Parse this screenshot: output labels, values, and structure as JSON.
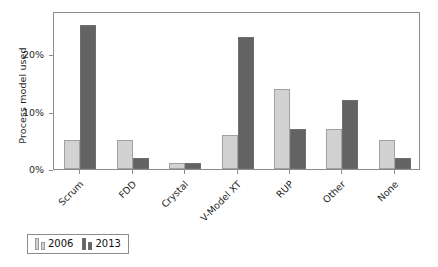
{
  "chart_data": {
    "type": "bar",
    "title": "",
    "subtitle": "",
    "xlabel": "",
    "ylabel": "Process model used",
    "categories": [
      "Scrum",
      "FDD",
      "Crystal",
      "V-Model XT",
      "RUP",
      "Other",
      "None"
    ],
    "series": [
      {
        "name": "2006",
        "color": "#d2d2d2",
        "values": [
          5,
          5,
          1,
          6,
          14,
          7,
          5
        ]
      },
      {
        "name": "2013",
        "color": "#636363",
        "values": [
          25,
          2,
          1,
          23,
          7,
          12,
          2
        ]
      }
    ],
    "ylim": [
      0,
      27.5
    ],
    "yticks": [
      0,
      10,
      20
    ],
    "ytick_labels": [
      "0%",
      "10%",
      "20%"
    ],
    "grid": false,
    "legend_position": "below-left",
    "value_unit": "%"
  },
  "legend": {
    "entries": [
      {
        "label": "2006"
      },
      {
        "label": "2013"
      }
    ]
  }
}
